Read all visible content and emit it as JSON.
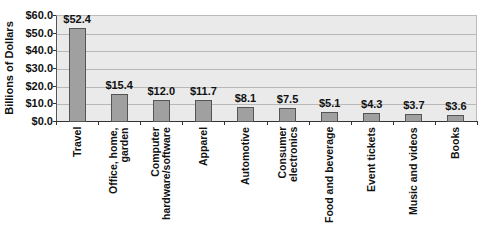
{
  "chart_data": {
    "type": "bar",
    "title": "",
    "xlabel": "",
    "ylabel": "Billions of Dollars",
    "ylim": [
      0,
      60
    ],
    "yticks": [
      "$0.0",
      "$10.0",
      "$20.0",
      "$30.0",
      "$40.0",
      "$50.0",
      "$60.0"
    ],
    "grid": true,
    "legend": null,
    "categories": [
      "Travel",
      "Office, home, garden",
      "Computer hardware/software",
      "Apparel",
      "Automotive",
      "Consumer electronics",
      "Food and beverage",
      "Event tickets",
      "Music and videos",
      "Books"
    ],
    "category_labels_display": [
      "Travel",
      "Office, home,\ngarden",
      "Computer\nhardware/software",
      "Apparel",
      "Automotive",
      "Consumer\nelectronics",
      "Food and beverage",
      "Event tickets",
      "Music and videos",
      "Books"
    ],
    "values": [
      52.4,
      15.4,
      12.0,
      11.7,
      8.1,
      7.5,
      5.1,
      4.3,
      3.7,
      3.6
    ],
    "value_labels": [
      "$52.4",
      "$15.4",
      "$12.0",
      "$11.7",
      "$8.1",
      "$7.5",
      "$5.1",
      "$4.3",
      "$3.7",
      "$3.6"
    ],
    "colors": {
      "bar": "#a0a0a0",
      "bar_border": "#555555",
      "plot_bg": "#eaeaea",
      "grid": "#b8b8b8"
    }
  }
}
